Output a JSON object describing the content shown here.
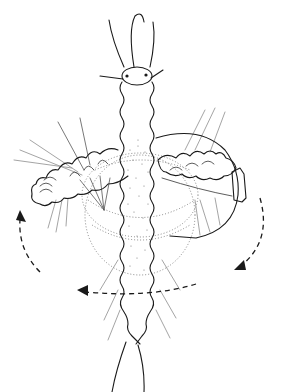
{
  "figure": {
    "type": "scientific-line-drawing",
    "background_color": "#ffffff",
    "ink_color": "#1a1a1a",
    "chaetae_color": "#9a9a9a",
    "text_labels": []
  },
  "elements": {
    "head": {
      "icon": "prostomium-with-antennae",
      "eyes": 2,
      "antennae": 3,
      "palps": 2
    },
    "body": {
      "icon": "segmented-trunk",
      "stippled_center": true
    },
    "left_parapodium": {
      "icon": "extended-parapodium-left"
    },
    "right_parapodium": {
      "icon": "extended-parapodium-right-with-aciculum"
    },
    "rotation_zone": {
      "icon": "dotted-ellipse-rotation-zone"
    },
    "tail": {
      "icon": "pygidium-tail"
    }
  },
  "arrows": [
    {
      "name": "left-rotation-arrow",
      "direction": "up",
      "style": "dashed"
    },
    {
      "name": "right-rotation-arrow",
      "direction": "down-left",
      "style": "dashed"
    },
    {
      "name": "bottom-rotation-arrow",
      "direction": "left",
      "style": "dashed"
    }
  ]
}
